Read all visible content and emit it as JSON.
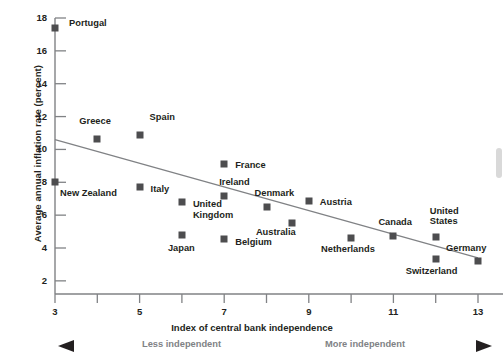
{
  "chart_data": {
    "type": "scatter",
    "title": "",
    "xlabel": "Index of central bank independence",
    "ylabel": "Average annual inflation rate (percent)",
    "xlim": [
      3,
      13
    ],
    "ylim": [
      1.2,
      18
    ],
    "xticks": [
      3,
      4,
      5,
      6,
      7,
      8,
      9,
      10,
      11,
      12,
      13
    ],
    "xticklabels": [
      "3",
      "",
      "5",
      "",
      "7",
      "",
      "9",
      "",
      "11",
      "",
      "13"
    ],
    "yticks": [
      2,
      4,
      6,
      8,
      10,
      12,
      14,
      16,
      18
    ],
    "yticklabels": [
      "2",
      "4",
      "6",
      "8",
      "10",
      "12",
      "14",
      "16",
      "18"
    ],
    "grid": false,
    "legend": null,
    "marker_color": "#4d4d4f",
    "trendline": {
      "type": "line",
      "x": [
        3,
        13
      ],
      "y": [
        10.6,
        3.4
      ],
      "color": "#808285"
    },
    "points": [
      {
        "label": "Portugal",
        "x": 3.0,
        "y": 17.4,
        "lx": 14,
        "ly": -5
      },
      {
        "label": "Greece",
        "x": 4.0,
        "y": 10.65,
        "lx": -18,
        "ly": -18
      },
      {
        "label": "Spain",
        "x": 5.0,
        "y": 10.9,
        "lx": 10,
        "ly": -18
      },
      {
        "label": "New Zealand",
        "x": 3.0,
        "y": 8.0,
        "lx": 5,
        "ly": 11
      },
      {
        "label": "Italy",
        "x": 5.0,
        "y": 7.7,
        "lx": 11,
        "ly": 2
      },
      {
        "label": "United\nKingdom",
        "x": 6.0,
        "y": 6.8,
        "lx": 11,
        "ly": 2
      },
      {
        "label": "Japan",
        "x": 6.0,
        "y": 4.8,
        "lx": -14,
        "ly": 13
      },
      {
        "label": "France",
        "x": 7.0,
        "y": 9.1,
        "lx": 11,
        "ly": 1
      },
      {
        "label": "Ireland",
        "x": 7.0,
        "y": 7.15,
        "lx": -5,
        "ly": -14
      },
      {
        "label": "Belgium",
        "x": 7.0,
        "y": 4.55,
        "lx": 11,
        "ly": 3
      },
      {
        "label": "Denmark",
        "x": 8.0,
        "y": 6.5,
        "lx": -12,
        "ly": -14
      },
      {
        "label": "Australia",
        "x": 8.6,
        "y": 5.55,
        "lx": -36,
        "ly": 9
      },
      {
        "label": "Austria",
        "x": 9.0,
        "y": 6.85,
        "lx": 11,
        "ly": 1
      },
      {
        "label": "Netherlands",
        "x": 10.0,
        "y": 4.6,
        "lx": -30,
        "ly": 11
      },
      {
        "label": "Canada",
        "x": 11.0,
        "y": 4.75,
        "lx": -15,
        "ly": -14
      },
      {
        "label": "United\nStates",
        "x": 12.0,
        "y": 4.7,
        "lx": -6,
        "ly": -26
      },
      {
        "label": "Switzerland",
        "x": 12.0,
        "y": 3.35,
        "lx": -30,
        "ly": 12
      },
      {
        "label": "Germany",
        "x": 13.0,
        "y": 3.2,
        "lx": -32,
        "ly": -13
      }
    ]
  },
  "axis_hints": {
    "left_text": "Less independent",
    "right_text": "More independent"
  }
}
